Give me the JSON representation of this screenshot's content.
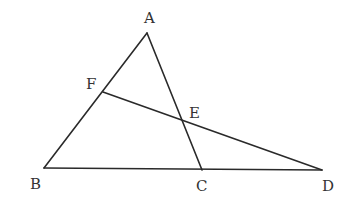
{
  "diagram": {
    "type": "geometry",
    "points": {
      "A": {
        "label": "A",
        "x": 147,
        "y": 33,
        "lx": 144,
        "ly": 23
      },
      "B": {
        "label": "B",
        "x": 44,
        "y": 168,
        "lx": 30,
        "ly": 189
      },
      "C": {
        "label": "C",
        "x": 202,
        "y": 170,
        "lx": 196,
        "ly": 191
      },
      "D": {
        "label": "D",
        "x": 322,
        "y": 170,
        "lx": 322,
        "ly": 191
      },
      "E": {
        "label": "E",
        "x": 183,
        "y": 120,
        "lx": 189,
        "ly": 118
      },
      "F": {
        "label": "F",
        "x": 103,
        "y": 92,
        "lx": 86,
        "ly": 89
      }
    },
    "segments": [
      {
        "name": "AB",
        "from": "A",
        "to": "B"
      },
      {
        "name": "AC",
        "from": "A",
        "to": "C"
      },
      {
        "name": "BD",
        "from": "B",
        "to": "D"
      },
      {
        "name": "FD",
        "from": "F",
        "to": "D"
      }
    ],
    "line_color": "#2a2a2a",
    "label_color": "#333333"
  }
}
